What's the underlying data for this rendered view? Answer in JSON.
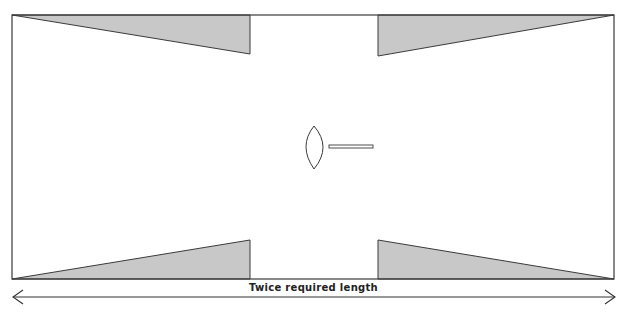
{
  "diagram": {
    "label": "Twice required length",
    "colors": {
      "stroke": "#3a3a3a",
      "wedge_fill": "#c8c8c8",
      "background": "#ffffff"
    },
    "elements": [
      {
        "name": "outer-rectangle",
        "x": 12,
        "y": 15,
        "width": 602,
        "height": 264
      },
      {
        "name": "wedge-top-left",
        "points": "12,15 250,15 250,54"
      },
      {
        "name": "wedge-top-right",
        "points": "378,15 614,15 378,56"
      },
      {
        "name": "wedge-bottom-left",
        "points": "12,279 250,279 250,240"
      },
      {
        "name": "wedge-bottom-right",
        "points": "378,240 378,279 614,279"
      },
      {
        "name": "lens-with-handle",
        "center": [
          318,
          146
        ]
      },
      {
        "name": "double-arrow",
        "y": 297,
        "x1": 12,
        "x2": 616
      }
    ]
  }
}
